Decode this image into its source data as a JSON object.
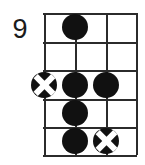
{
  "diagram": {
    "kind": "guitar-chord-diagram",
    "fret_number_label": "9",
    "strings": 4,
    "frets": 5,
    "colors": {
      "line": "#2b2b2b",
      "marker_fill": "#111111",
      "marker_x": "#ffffff",
      "background": "#ffffff",
      "label_text": "#1b1b1b"
    },
    "string_positions_px": [
      0,
      31,
      62,
      92
    ],
    "fret_positions_px": [
      0,
      29,
      57,
      86,
      114,
      142
    ],
    "markers": [
      {
        "name": "marker-string2-fret1",
        "type": "dot",
        "string": 2,
        "fret": 1,
        "x": 31,
        "y": 14
      },
      {
        "name": "marker-string1-fret3",
        "type": "xdot",
        "string": 1,
        "fret": 3,
        "x": 0,
        "y": 72
      },
      {
        "name": "marker-string2-fret3",
        "type": "dot",
        "string": 2,
        "fret": 3,
        "x": 31,
        "y": 72
      },
      {
        "name": "marker-string3-fret3",
        "type": "dot",
        "string": 3,
        "fret": 3,
        "x": 62,
        "y": 72
      },
      {
        "name": "marker-string2-fret4",
        "type": "dot",
        "string": 2,
        "fret": 4,
        "x": 31,
        "y": 100
      },
      {
        "name": "marker-string2-fret5",
        "type": "dot",
        "string": 2,
        "fret": 5,
        "x": 31,
        "y": 128
      },
      {
        "name": "marker-string3-fret5",
        "type": "xdot",
        "string": 3,
        "fret": 5,
        "x": 62,
        "y": 128
      }
    ]
  }
}
